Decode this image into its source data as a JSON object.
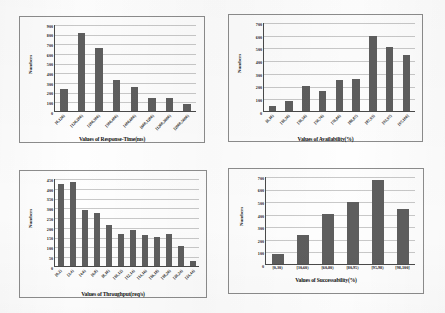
{
  "figure": {
    "panels": [
      "response-time",
      "availability",
      "throughput",
      "successability"
    ]
  },
  "chart_data": [
    {
      "type": "bar",
      "id": "response-time",
      "title": "",
      "xlabel": "Values of Response-Time(ms)",
      "ylabel": "Numbers",
      "categories": [
        "[0,120)",
        "[120,200)",
        "[200,300)",
        "[300,400)",
        "[400,600)",
        "[600,1200)",
        "[1200,2000)",
        "[2000,5000)"
      ],
      "values": [
        225,
        810,
        650,
        320,
        250,
        130,
        130,
        75
      ],
      "yticks": [
        0,
        100,
        200,
        300,
        400,
        500,
        600,
        700,
        800,
        900
      ],
      "ylim": [
        0,
        900
      ],
      "grid": true,
      "legend": "none"
    },
    {
      "type": "bar",
      "id": "availability",
      "title": "",
      "xlabel": "Values of Availability(%)",
      "ylabel": "Numbers",
      "categories": [
        "[0,10)",
        "[10,30)",
        "[30,50)",
        "[50,70)",
        "[70,80)",
        "[80,87)",
        "[87,93)",
        "[93,97)",
        "[97,100]"
      ],
      "values": [
        40,
        75,
        195,
        155,
        245,
        250,
        590,
        500,
        440
      ],
      "yticks": [
        0,
        100,
        200,
        300,
        400,
        500,
        600,
        700
      ],
      "ylim": [
        0,
        700
      ],
      "grid": true,
      "legend": "none"
    },
    {
      "type": "bar",
      "id": "throughput",
      "title": "",
      "xlabel": "Values of Throughput(req/s)",
      "ylabel": "Numbers",
      "categories": [
        "[0,2)",
        "[2,4)",
        "[4,6)",
        "[6,8)",
        "[8,10)",
        "[10,12)",
        "[12,14)",
        "[14,16)",
        "[16,18)",
        "[18,20)",
        "[20,24)",
        "[24,44)"
      ],
      "values": [
        418,
        428,
        288,
        272,
        210,
        162,
        183,
        157,
        148,
        165,
        100,
        28
      ],
      "yticks": [
        0,
        50,
        100,
        150,
        200,
        250,
        300,
        350,
        400,
        450
      ],
      "ylim": [
        0,
        450
      ],
      "grid": true,
      "legend": "none"
    },
    {
      "type": "bar",
      "id": "successability",
      "title": "",
      "xlabel": "Values of Successability(%)",
      "ylabel": "Numbers",
      "categories": [
        "[0,30)",
        "[30,60)",
        "[60,80)",
        "[80,95)",
        "[95,98)",
        "[98,100]"
      ],
      "values": [
        80,
        230,
        400,
        495,
        665,
        440
      ],
      "yticks": [
        0,
        100,
        200,
        300,
        400,
        500,
        600,
        700
      ],
      "ylim": [
        0,
        700
      ],
      "grid": true,
      "legend": "none"
    }
  ],
  "style": {
    "bar_color": "#5e5e5e",
    "grid_color": "#c9c9c9",
    "axis_color": "#4a4a4a",
    "text_color": "#1a1a1a",
    "background": "#ffffff"
  }
}
